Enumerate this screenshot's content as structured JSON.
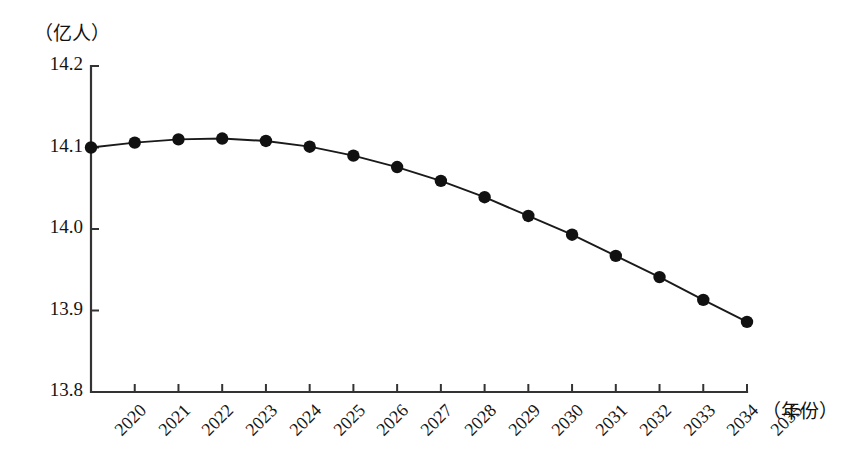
{
  "chart_data": {
    "type": "line",
    "title": "",
    "subtitle": "",
    "xlabel": "（年份）",
    "ylabel": "（亿人）",
    "categories": [
      "2020",
      "2021",
      "2022",
      "2023",
      "2024",
      "2025",
      "2026",
      "2027",
      "2028",
      "2029",
      "2030",
      "2031",
      "2032",
      "2033",
      "2034",
      "2035"
    ],
    "values": [
      14.1,
      14.106,
      14.11,
      14.111,
      14.108,
      14.101,
      14.09,
      14.076,
      14.059,
      14.039,
      14.016,
      13.993,
      13.967,
      13.941,
      13.913,
      13.886
    ],
    "series": [
      {
        "name": "人口",
        "values": [
          14.1,
          14.106,
          14.11,
          14.111,
          14.108,
          14.101,
          14.09,
          14.076,
          14.059,
          14.039,
          14.016,
          13.993,
          13.967,
          13.941,
          13.913,
          13.886
        ]
      }
    ],
    "ylim": [
      13.8,
      14.2
    ],
    "xlim": [
      "2020",
      "2035"
    ],
    "y_ticks": [
      "13.8",
      "13.9",
      "14.0",
      "14.1",
      "14.2"
    ],
    "y_tick_values": [
      13.8,
      13.9,
      14.0,
      14.1,
      14.2
    ],
    "grid": false,
    "legend": "none",
    "marker": "filled-circle",
    "line_color": "#1a1a1a",
    "marker_color": "#111111",
    "axis_color": "#333333",
    "background": "#ffffff"
  },
  "axes": {
    "y_unit_label": "（亿人）",
    "x_unit_label": "（年份）"
  }
}
